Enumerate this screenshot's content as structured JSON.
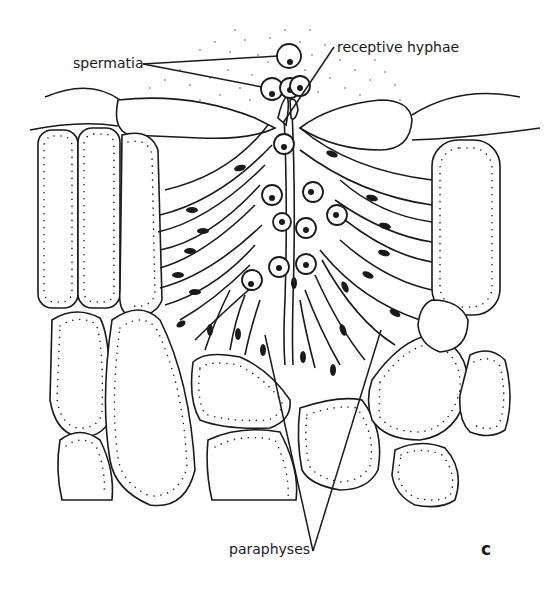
{
  "figure": {
    "panel_letter": "c",
    "labels": {
      "spermatia": "spermatia",
      "receptive_hyphae": "receptive hyphae",
      "paraphyses": "paraphyses"
    },
    "colors": {
      "ink": "#1a1a1a",
      "background": "#ffffff"
    }
  }
}
